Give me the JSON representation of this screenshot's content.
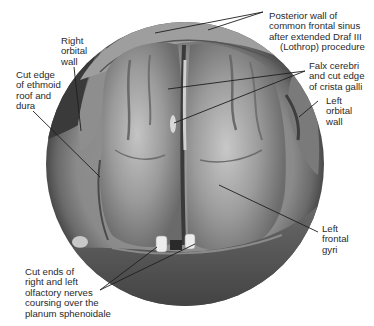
{
  "figure": {
    "kind": "endoscopic anatomical illustration",
    "colors": {
      "background": "#ffffff",
      "circle_rim": "#5a5a5a",
      "brain_mid": "#8c8c8c",
      "brain_light": "#b4b4b4",
      "shadow": "#3a3a3a",
      "leader_line": "#1e1e1e",
      "text": "#2a2a2a"
    },
    "labels": {
      "posterior_wall": {
        "lines": [
          "Posterior wall of",
          "common frontal sinus",
          "after extended Draf III",
          "(Lothrop) procedure"
        ]
      },
      "falx_cerebri": {
        "lines": [
          "Falx cerebri",
          "and cut edge",
          "of crista galli"
        ]
      },
      "left_orbital_wall": {
        "lines": [
          "Left",
          "orbital",
          "wall"
        ]
      },
      "right_orbital_wall": {
        "lines": [
          "Right",
          "orbital",
          "wall"
        ]
      },
      "cut_edge_ethmoid": {
        "lines": [
          "Cut edge",
          "of ethmoid",
          "roof and",
          "dura"
        ]
      },
      "left_frontal_gyri": {
        "lines": [
          "Left",
          "frontal",
          "gyri"
        ]
      },
      "olfactory_nerves": {
        "lines": [
          "Cut ends of",
          "right and left",
          "olfactory nerves",
          "coursing over the",
          "planum sphenoidale"
        ]
      }
    }
  }
}
